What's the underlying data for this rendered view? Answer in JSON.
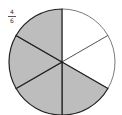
{
  "fraction": {
    "numerator": "4",
    "denominator": "6"
  },
  "colors": {
    "shaded": "#bdbdbd",
    "unshaded": "#ffffff",
    "stroke": "#222222"
  },
  "pie": {
    "slices": 6,
    "shaded": 4
  }
}
